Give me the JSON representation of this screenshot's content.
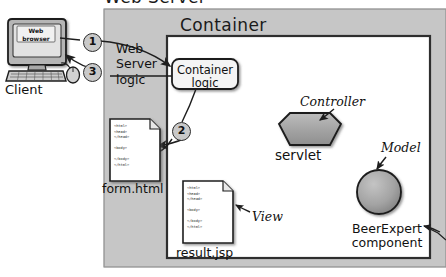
{
  "diagram": {
    "title": "Web Server",
    "container_title": "Container",
    "client_label": "Client",
    "browser_label": "Web\nbrowser",
    "web_server_logic": "Web\nServer\nlogic",
    "container_logic": "Container\nlogic",
    "servlet_label": "servlet",
    "controller_annotation": "Controller",
    "model_annotation": "Model",
    "view_annotation": "View",
    "beer_expert_label": "BeerExpert\ncomponent",
    "form_file": "form.html",
    "result_file": "result.jsp",
    "steps": [
      {
        "number": "1"
      },
      {
        "number": "2"
      },
      {
        "number": "3"
      }
    ],
    "code_snippet": "<html>\n<head>\n</head>\n\n<body>\n\n</body>\n</html>",
    "colors": {
      "server_fill": "#c6c6c6",
      "container_fill": "#ffffff",
      "shape_fill": "#a8a8a8",
      "circle_fill": "#c9c9c9",
      "outline": "#2c2c2c",
      "page_background": "#ffffff"
    }
  }
}
